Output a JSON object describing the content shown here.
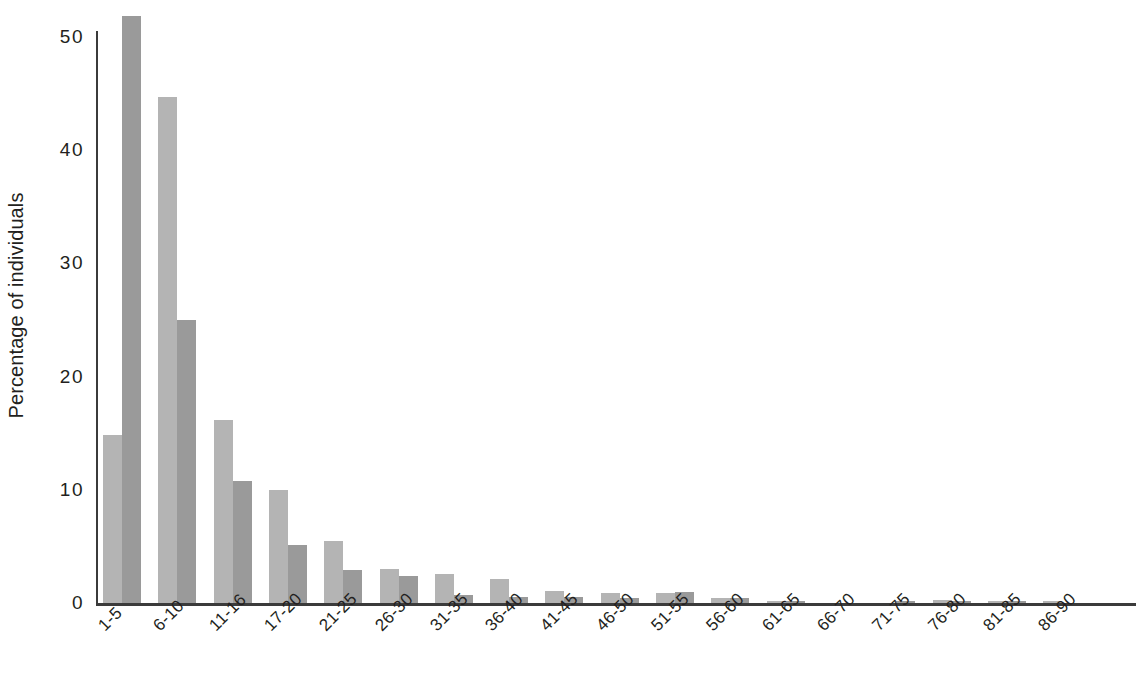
{
  "chart_data": {
    "type": "bar",
    "title": "",
    "subtitle": "",
    "xlabel": "",
    "ylabel": "Percentage of individuals",
    "ylim": [
      0,
      52
    ],
    "yticks": [
      0,
      10,
      20,
      30,
      40,
      50
    ],
    "ytick_labels": [
      "0",
      "10",
      "20",
      "30",
      "40",
      "50"
    ],
    "grid": false,
    "legend": "none",
    "orientation": "vertical",
    "grouping": "grouped",
    "categories": [
      "1-5",
      "6-10",
      "11-16",
      "17-20",
      "21-25",
      "26-30",
      "31-35",
      "36-40",
      "41-45",
      "46-50",
      "51-55",
      "56-60",
      "61-65",
      "66-70",
      "71-75",
      "76-80",
      "81-85",
      "86-90"
    ],
    "series": [
      {
        "name": "series-1",
        "color": "#b4b4b4",
        "values": [
          14.8,
          44.7,
          16.2,
          10.0,
          5.5,
          3.0,
          2.6,
          2.1,
          1.1,
          0.9,
          0.9,
          0.4,
          0.2,
          0.0,
          0.0,
          0.3,
          0.2,
          0.1
        ]
      },
      {
        "name": "series-2",
        "color": "#9a9a9a",
        "values": [
          51.9,
          25.0,
          10.8,
          5.1,
          2.9,
          2.4,
          0.7,
          0.5,
          0.5,
          0.4,
          1.0,
          0.4,
          0.1,
          0.0,
          0.2,
          0.2,
          0.1,
          0.0
        ]
      }
    ]
  },
  "axis": {
    "y_title": "Percentage of individuals",
    "axis_color": "#3b3b3b"
  }
}
